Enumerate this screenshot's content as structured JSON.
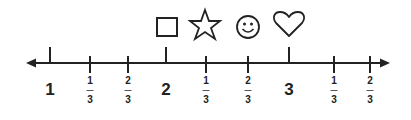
{
  "number_line": {
    "axis": {
      "y": 63,
      "x_start": 28,
      "x_end": 388,
      "color": "#222222",
      "arrows": "both"
    },
    "whole_labels": [
      {
        "text": "1",
        "x": 50
      },
      {
        "text": "2",
        "x": 166
      },
      {
        "text": "3",
        "x": 289
      }
    ],
    "fraction_labels": [
      {
        "num": "1",
        "den": "3",
        "x": 90
      },
      {
        "num": "2",
        "den": "3",
        "x": 128
      },
      {
        "num": "1",
        "den": "3",
        "x": 206
      },
      {
        "num": "2",
        "den": "3",
        "x": 248
      },
      {
        "num": "1",
        "den": "3",
        "x": 334
      },
      {
        "num": "2",
        "den": "3",
        "x": 370
      }
    ],
    "symbols": [
      {
        "name": "square",
        "x": 166
      },
      {
        "name": "star",
        "x": 205
      },
      {
        "name": "smiley",
        "x": 248
      },
      {
        "name": "heart",
        "x": 289
      }
    ]
  }
}
